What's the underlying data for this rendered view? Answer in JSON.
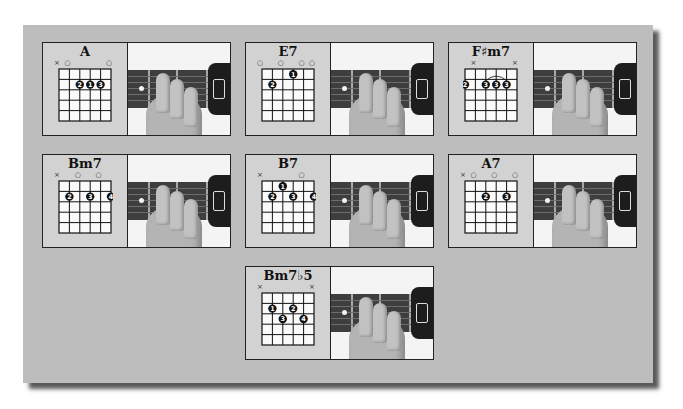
{
  "page": {
    "background": "#ffffff",
    "panel_color": "#bdbdbd"
  },
  "chords": [
    {
      "name": "A",
      "markers": [
        "×",
        "○",
        "",
        "",
        "",
        "○"
      ],
      "dots": [
        {
          "string": 3,
          "fret": 2,
          "finger": "2"
        },
        {
          "string": 4,
          "fret": 2,
          "finger": "1"
        },
        {
          "string": 5,
          "fret": 2,
          "finger": "3"
        }
      ],
      "barre": null
    },
    {
      "name": "E7",
      "markers": [
        "○",
        "",
        "○",
        "",
        "○",
        "○"
      ],
      "dots": [
        {
          "string": 2,
          "fret": 2,
          "finger": "2"
        },
        {
          "string": 4,
          "fret": 1,
          "finger": "1"
        }
      ],
      "barre": null
    },
    {
      "name": "F♯m7",
      "markers": [
        "",
        "×",
        "",
        "",
        "",
        "×"
      ],
      "dots": [
        {
          "string": 1,
          "fret": 2,
          "finger": "2"
        },
        {
          "string": 3,
          "fret": 2,
          "finger": "3"
        },
        {
          "string": 4,
          "fret": 2,
          "finger": "3"
        },
        {
          "string": 5,
          "fret": 2,
          "finger": "3"
        }
      ],
      "barre": {
        "from": 3,
        "to": 5,
        "fret": 2
      }
    },
    {
      "name": "Bm7",
      "markers": [
        "×",
        "",
        "○",
        "",
        "○",
        ""
      ],
      "dots": [
        {
          "string": 2,
          "fret": 2,
          "finger": "2"
        },
        {
          "string": 4,
          "fret": 2,
          "finger": "3"
        },
        {
          "string": 6,
          "fret": 2,
          "finger": "4"
        }
      ],
      "barre": null
    },
    {
      "name": "B7",
      "markers": [
        "×",
        "",
        "",
        "",
        "○",
        ""
      ],
      "dots": [
        {
          "string": 3,
          "fret": 1,
          "finger": "1"
        },
        {
          "string": 2,
          "fret": 2,
          "finger": "2"
        },
        {
          "string": 4,
          "fret": 2,
          "finger": "3"
        },
        {
          "string": 6,
          "fret": 2,
          "finger": "4"
        }
      ],
      "barre": null
    },
    {
      "name": "A7",
      "markers": [
        "×",
        "○",
        "",
        "○",
        "",
        "○"
      ],
      "dots": [
        {
          "string": 3,
          "fret": 2,
          "finger": "2"
        },
        {
          "string": 5,
          "fret": 2,
          "finger": "3"
        }
      ],
      "barre": null
    },
    {
      "name": "Bm7♭5",
      "markers": [
        "×",
        "",
        "",
        "",
        "",
        "×"
      ],
      "dots": [
        {
          "string": 2,
          "fret": 2,
          "finger": "1"
        },
        {
          "string": 3,
          "fret": 3,
          "finger": "3"
        },
        {
          "string": 4,
          "fret": 2,
          "finger": "2"
        },
        {
          "string": 5,
          "fret": 3,
          "finger": "4"
        }
      ],
      "barre": null
    }
  ]
}
